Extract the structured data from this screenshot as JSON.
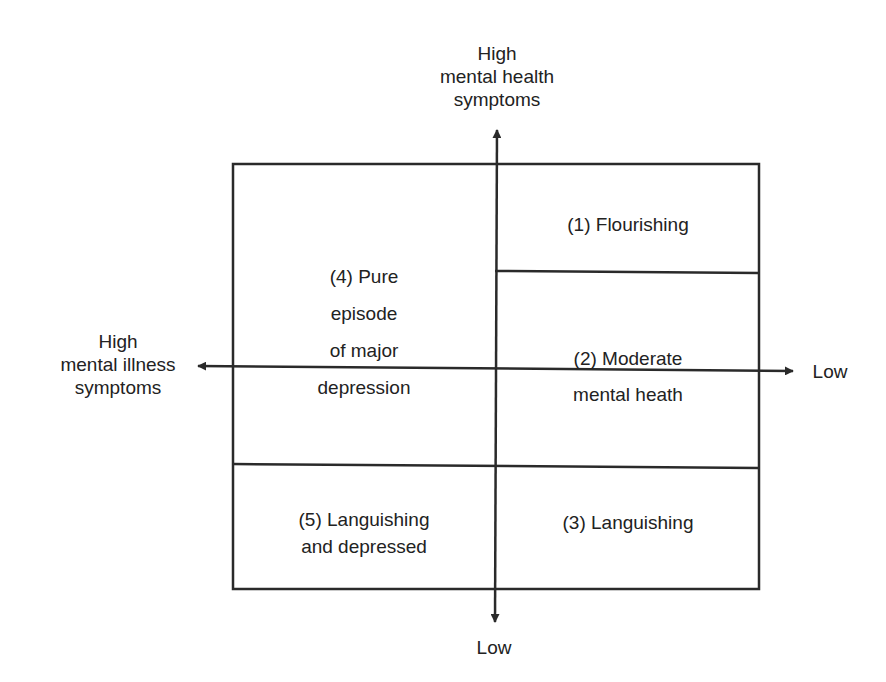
{
  "diagram": {
    "type": "two-continua quadrant model",
    "colors": {
      "line": "#2a2a2a",
      "text": "#222222",
      "background": "#ffffff"
    },
    "axes": {
      "vertical": {
        "top_label": [
          "High",
          "mental health",
          "symptoms"
        ],
        "bottom_label": "Low"
      },
      "horizontal": {
        "left_label": [
          "High",
          "mental illness",
          "symptoms"
        ],
        "right_label": "Low"
      }
    },
    "cells": {
      "flourishing": [
        "(1) Flourishing"
      ],
      "moderate": [
        "(2) Moderate",
        "mental heath"
      ],
      "languishing": [
        "(3) Languishing"
      ],
      "pure_depression": [
        "(4) Pure",
        "episode",
        "of major",
        "depression"
      ],
      "languishing_depressed": [
        "(5) Languishing",
        "and depressed"
      ]
    }
  }
}
